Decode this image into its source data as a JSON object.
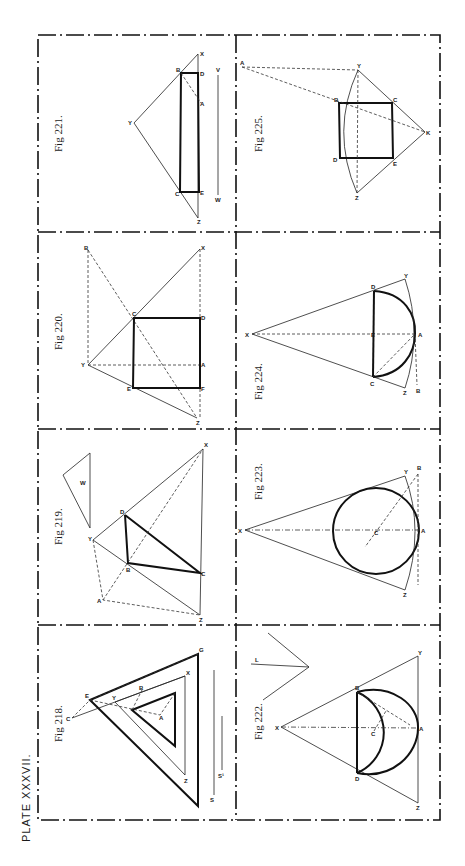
{
  "plate": {
    "title": "Plate XXXVII.",
    "title_display": "PLATE XXXVII.",
    "orientation": "rotated 90° counter-clockwise",
    "ink_color": "#111111",
    "paper_color": "#ffffff"
  },
  "figures": [
    {
      "id": "fig-218",
      "caption": "Fig 218.",
      "labels": [
        "C",
        "E",
        "Y",
        "B",
        "A",
        "X",
        "G",
        "Z",
        "S",
        "S'"
      ]
    },
    {
      "id": "fig-219",
      "caption": "Fig 219.",
      "labels": [
        "X",
        "D",
        "Y",
        "B",
        "C",
        "A",
        "Z",
        "W"
      ]
    },
    {
      "id": "fig-220",
      "caption": "Fig 220.",
      "labels": [
        "B",
        "X",
        "C",
        "D",
        "Y",
        "A",
        "E",
        "F",
        "Z"
      ]
    },
    {
      "id": "fig-221",
      "caption": "Fig 221.",
      "labels": [
        "X",
        "B",
        "D",
        "A",
        "Y",
        "C",
        "E",
        "Z",
        "V",
        "W"
      ]
    },
    {
      "id": "fig-222",
      "caption": "Fig 222.",
      "labels": [
        "L",
        "X",
        "B",
        "D",
        "C",
        "A",
        "Y",
        "Z"
      ]
    },
    {
      "id": "fig-223",
      "caption": "Fig 223.",
      "labels": [
        "X",
        "C",
        "Y",
        "B",
        "A",
        "Z"
      ]
    },
    {
      "id": "fig-224",
      "caption": "Fig 224.",
      "labels": [
        "X",
        "D",
        "Y",
        "E",
        "A",
        "C",
        "Z",
        "B"
      ]
    },
    {
      "id": "fig-225",
      "caption": "Fig 225.",
      "labels": [
        "A",
        "Y",
        "B",
        "C",
        "K",
        "D",
        "E",
        "Z"
      ]
    }
  ],
  "labels": {
    "f218": {
      "C": "C",
      "E": "E",
      "Y": "Y",
      "B": "B",
      "A": "A",
      "X": "X",
      "G": "G",
      "Z": "Z",
      "S": "S",
      "S1": "S¹"
    },
    "f219": {
      "X": "X",
      "D": "D",
      "Y": "Y",
      "B": "B",
      "C": "C",
      "A": "A",
      "Z": "Z",
      "W": "W"
    },
    "f220": {
      "B": "B",
      "X": "X",
      "C": "C",
      "D": "D",
      "Y": "Y",
      "A": "A",
      "E": "E",
      "F": "F",
      "Z": "Z"
    },
    "f221": {
      "X": "X",
      "B": "B",
      "D": "D",
      "A": "A",
      "Y": "Y",
      "C": "C",
      "E": "E",
      "Z": "Z",
      "V": "V",
      "W": "W"
    },
    "f222": {
      "L": "L",
      "X": "X",
      "B": "B",
      "D": "D",
      "C": "C",
      "A": "A",
      "Y": "Y",
      "Z": "Z"
    },
    "f223": {
      "X": "X",
      "C": "C",
      "Y": "Y",
      "B": "B",
      "A": "A",
      "Z": "Z"
    },
    "f224": {
      "X": "X",
      "D": "D",
      "Y": "Y",
      "E": "E",
      "A": "A",
      "C": "C",
      "Z": "Z",
      "B": "B"
    },
    "f225": {
      "A": "A",
      "Y": "Y",
      "B": "B",
      "C": "C",
      "K": "K",
      "D": "D",
      "E": "E",
      "Z": "Z"
    }
  }
}
